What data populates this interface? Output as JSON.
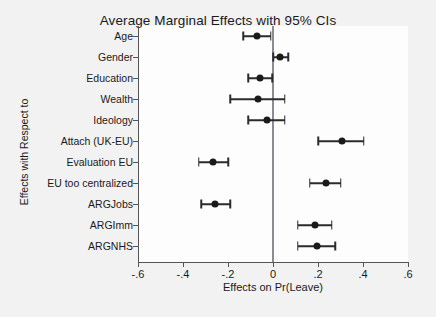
{
  "chart_data": {
    "type": "scatter",
    "title": "Average Marginal Effects with 95% CIs",
    "xlabel": "Effects on Pr(Leave)",
    "ylabel": "Effects with Respect to",
    "xlim": [
      -0.6,
      0.6
    ],
    "xticks": [
      -0.6,
      -0.4,
      -0.2,
      0,
      0.2,
      0.4,
      0.6
    ],
    "xticklabels": [
      "-.6",
      "-.4",
      "-.2",
      "0",
      ".2",
      ".4",
      ".6"
    ],
    "grid": false,
    "legend": "none",
    "reference_line": 0,
    "categories": [
      "Age",
      "Gender",
      "Education",
      "Wealth",
      "Ideology",
      "Attach (UK-EU)",
      "Evaluation EU",
      "EU too centralized",
      "ARGJobs",
      "ARGImm",
      "ARGNHS"
    ],
    "estimates": [
      -0.071,
      0.031,
      -0.058,
      -0.067,
      -0.027,
      0.307,
      -0.267,
      0.236,
      -0.258,
      0.187,
      0.196
    ],
    "ci_low": [
      -0.133,
      0.0,
      -0.111,
      -0.191,
      -0.111,
      0.2,
      -0.329,
      0.164,
      -0.32,
      0.111,
      0.111
    ],
    "ci_high": [
      -0.009,
      0.067,
      -0.004,
      0.053,
      0.053,
      0.404,
      -0.2,
      0.302,
      -0.191,
      0.262,
      0.276
    ],
    "marker_color": "#1a1a1a",
    "ci_color": "#2b2b2b",
    "zero_line_color": "#8b8b94",
    "plot_background": "#fdfdfd",
    "figure_background": "#f2f2f2"
  }
}
